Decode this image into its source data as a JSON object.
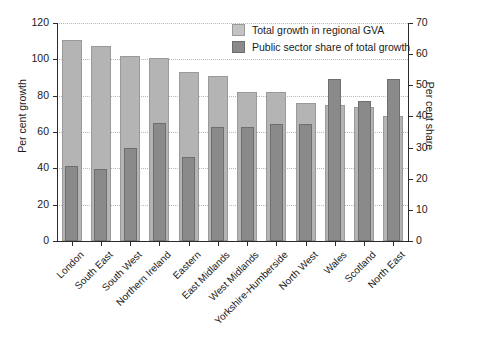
{
  "chart_data": {
    "type": "bar",
    "title": "",
    "subtitle": "",
    "categories": [
      "London",
      "South East",
      "South West",
      "Northern Ireland",
      "Eastern",
      "East Midlands",
      "West Midlands",
      "Yorkshire-Humberside",
      "North West",
      "Wales",
      "Scotland",
      "North East"
    ],
    "series": [
      {
        "name": "Total growth in regional GVA",
        "axis": "left",
        "color": "#b4b4b4",
        "values": [
          110.5,
          107.5,
          102,
          100.5,
          93,
          91,
          82,
          82,
          76,
          75,
          73.5,
          69
        ]
      },
      {
        "name": "Public sector share of total growth",
        "axis": "right",
        "color": "#8a8a8a",
        "values": [
          24,
          23,
          30,
          38,
          27,
          36.5,
          36.5,
          37.5,
          37.5,
          52,
          45,
          52
        ]
      }
    ],
    "xlabel": "",
    "ylabel": "Per cent growth",
    "ylabel_right": "Per cent share",
    "ylim": [
      0,
      120
    ],
    "ylim_right": [
      0,
      70
    ],
    "yticks": [
      0,
      20,
      40,
      60,
      80,
      100,
      120
    ],
    "yticks_right": [
      0,
      10,
      20,
      30,
      40,
      50,
      60,
      70
    ],
    "grid": true,
    "grid_style": "dotted-horizontal",
    "legend_position": "top-right"
  },
  "legend": {
    "items": [
      {
        "label": "Total growth in regional GVA",
        "swatch": "total"
      },
      {
        "label": "Public sector share of total growth",
        "swatch": "public"
      }
    ]
  },
  "axes": {
    "left_title": "Per cent growth",
    "right_title": "Per cent share"
  }
}
